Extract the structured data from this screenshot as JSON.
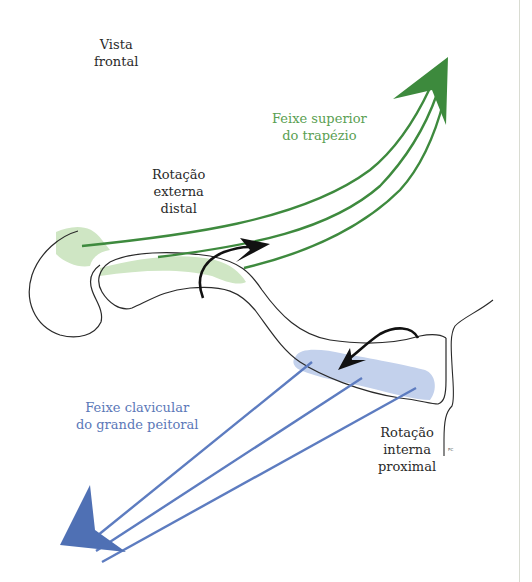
{
  "labels": {
    "view": [
      "Vista",
      "frontal"
    ],
    "upper_trapezius": [
      "Feixe superior",
      "do trapézio"
    ],
    "external_rotation": [
      "Rotação",
      "externa",
      "distal"
    ],
    "clavicular_pectoralis": [
      "Feixe clavicular",
      "do grande peitoral"
    ],
    "internal_rotation": [
      "Rotação",
      "interna",
      "proximal"
    ],
    "corner_mark": "PC"
  },
  "colors": {
    "green_fill": "#cfe6c4",
    "green_line": "#3e8a3e",
    "green_arrow": "#3d8a3d",
    "blue_fill": "#c3d1ec",
    "blue_line": "#5d7cc0",
    "blue_arrow": "#4f70b4",
    "outline": "#2a2a2a",
    "rotation_arrow": "#111111"
  }
}
